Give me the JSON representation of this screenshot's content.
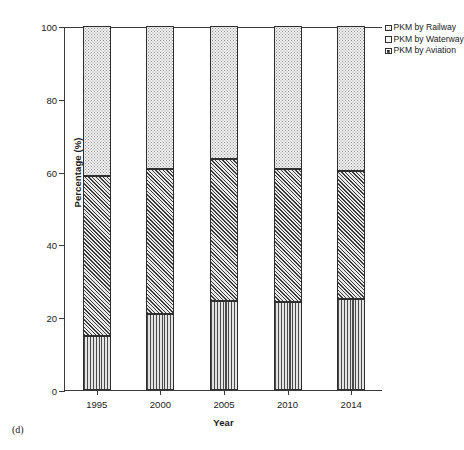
{
  "panel_caption": "(d)",
  "legend": {
    "position": "top-right",
    "items": [
      {
        "label": "PKM by Railway",
        "pattern": "dots"
      },
      {
        "label": "PKM by Waterway",
        "pattern": "diagonal-hatch"
      },
      {
        "label": "PKM by Aviation",
        "pattern": "vertical-lines"
      }
    ]
  },
  "axes": {
    "y_title": "Percentage (%)",
    "x_title": "Year",
    "y_ticks": [
      "0",
      "20",
      "40",
      "60",
      "80",
      "100"
    ],
    "x_ticks": [
      "1995",
      "2000",
      "2005",
      "2010",
      "2014"
    ]
  },
  "chart_data": {
    "type": "bar",
    "title": "",
    "subtitle": "",
    "xlabel": "Year",
    "ylabel": "Percentage (%)",
    "categories": [
      "1995",
      "2000",
      "2005",
      "2010",
      "2014"
    ],
    "ylim": [
      0,
      100
    ],
    "xlim_note": "categorical",
    "ytick_values": [
      0,
      20,
      40,
      60,
      80,
      100
    ],
    "grid": false,
    "stacked": true,
    "stack_order_bottom_to_top": [
      "PKM by Aviation",
      "PKM by Waterway",
      "PKM by Railway"
    ],
    "legend_position": "upper right, outside axes",
    "series": [
      {
        "name": "PKM by Aviation",
        "pattern": "vertical-lines",
        "values": [
          14.8,
          20.9,
          24.5,
          24.2,
          25.0
        ]
      },
      {
        "name": "PKM by Waterway",
        "pattern": "diagonal-hatch",
        "values": [
          44.0,
          39.8,
          39.0,
          36.5,
          35.2
        ]
      },
      {
        "name": "PKM by Railway",
        "pattern": "dots",
        "values": [
          41.2,
          39.3,
          36.5,
          39.3,
          39.8
        ]
      }
    ],
    "cumulative_tops": {
      "PKM by Aviation": [
        14.8,
        20.9,
        24.5,
        24.2,
        25.0
      ],
      "PKM by Waterway": [
        58.8,
        60.7,
        63.5,
        60.7,
        60.2
      ],
      "PKM by Railway": [
        100,
        100,
        100,
        100,
        100
      ]
    },
    "annotations": [
      "(d)"
    ]
  },
  "colors": {
    "axis": "#3a3a3a",
    "bar_outline": "#2e2e2e",
    "railway_fill": "#f2f2f2",
    "waterway_fill": "#cfcfcf",
    "aviation_fill": "#d7d7d7",
    "background": "#ffffff",
    "text": "#1a1a1a"
  }
}
